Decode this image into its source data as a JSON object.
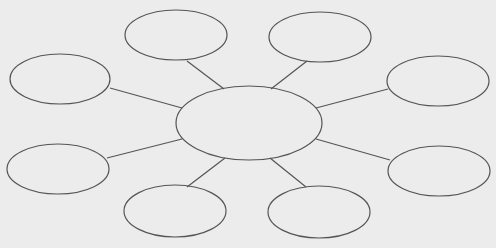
{
  "diagram": {
    "type": "bubble-map",
    "background": "#ececec",
    "stroke": "#555555",
    "center": {
      "label": "",
      "cx": 249,
      "cy": 123,
      "rx": 73,
      "ry": 37
    },
    "nodes": [
      {
        "id": "top-left",
        "label": "",
        "cx": 176,
        "cy": 35,
        "rx": 51,
        "ry": 25,
        "line": [
          187,
          61,
          224,
          89
        ]
      },
      {
        "id": "top-right",
        "label": "",
        "cx": 320,
        "cy": 37,
        "rx": 51,
        "ry": 25,
        "line": [
          307,
          61,
          271,
          89
        ]
      },
      {
        "id": "left",
        "label": "",
        "cx": 60,
        "cy": 79,
        "rx": 50,
        "ry": 25,
        "line": [
          110,
          88,
          182,
          108
        ]
      },
      {
        "id": "right",
        "label": "",
        "cx": 438,
        "cy": 81,
        "rx": 51,
        "ry": 25,
        "line": [
          388,
          89,
          316,
          108
        ]
      },
      {
        "id": "bottom-left",
        "label": "",
        "cx": 58,
        "cy": 169,
        "rx": 51,
        "ry": 25,
        "line": [
          107,
          158,
          182,
          139
        ]
      },
      {
        "id": "bottom-right",
        "label": "",
        "cx": 439,
        "cy": 171,
        "rx": 51,
        "ry": 25,
        "line": [
          390,
          160,
          316,
          139
        ]
      },
      {
        "id": "bottom-mid-left",
        "label": "",
        "cx": 175,
        "cy": 211,
        "rx": 51,
        "ry": 26,
        "line": [
          187,
          187,
          225,
          158
        ]
      },
      {
        "id": "bottom-mid-right",
        "label": "",
        "cx": 319,
        "cy": 212,
        "rx": 51,
        "ry": 26,
        "line": [
          306,
          187,
          270,
          158
        ]
      }
    ]
  }
}
